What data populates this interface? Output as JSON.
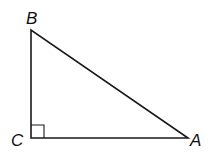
{
  "diagram": {
    "type": "right-triangle",
    "vertices": {
      "B": {
        "label": "B",
        "x": 31,
        "y": 30
      },
      "C": {
        "label": "C",
        "x": 31,
        "y": 138
      },
      "A": {
        "label": "A",
        "x": 188,
        "y": 138
      }
    },
    "right_angle_at": "C",
    "right_angle_marker_size": 13,
    "stroke_color": "#1a1a1a",
    "background": "#ffffff"
  }
}
